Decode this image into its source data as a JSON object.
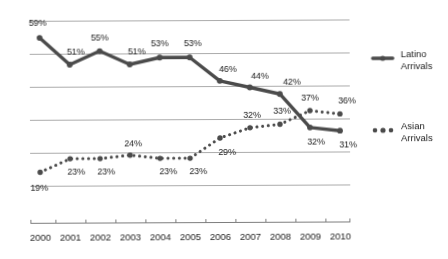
{
  "chart_data": {
    "type": "line",
    "title": "",
    "subtitle": "",
    "xlabel": "",
    "ylabel": "",
    "categories": [
      "2000",
      "2001",
      "2002",
      "2003",
      "2004",
      "2005",
      "2006",
      "2007",
      "2008",
      "2009",
      "2010"
    ],
    "ylim": [
      15,
      62
    ],
    "grid": true,
    "gridlines": 6,
    "y_tick_labels": [],
    "legend_position": "right",
    "value_suffix": "%",
    "series": [
      {
        "name": "Latino Arrivals",
        "legend_label_line1": "Latino",
        "legend_label_line2": "Arrivals",
        "style": "solid",
        "color": "#4d4d4d",
        "values": [
          59,
          51,
          55,
          51,
          53,
          53,
          46,
          44,
          42,
          32,
          31
        ],
        "labels": [
          "59%",
          "51%",
          "55%",
          "51%",
          "53%",
          "53%",
          "46%",
          "44%",
          "42%",
          "32%",
          "31%"
        ]
      },
      {
        "name": "Asian Arrivals",
        "legend_label_line1": "Asian",
        "legend_label_line2": "Arrivals",
        "style": "dotted",
        "color": "#4d4d4d",
        "values": [
          19,
          23,
          23,
          24,
          23,
          23,
          29,
          32,
          33,
          37,
          36
        ],
        "labels": [
          "19%",
          "23%",
          "23%",
          "24%",
          "23%",
          "23%",
          "29%",
          "32%",
          "33%",
          "37%",
          "36%"
        ]
      }
    ],
    "annotations": []
  },
  "legend": {
    "items": [
      {
        "label_line1": "Latino",
        "label_line2": "Arrivals",
        "marker": "solid-line-marker"
      },
      {
        "label_line1": "Asian",
        "label_line2": "Arrivals",
        "marker": "dotted-line-marker"
      }
    ]
  },
  "axis": {
    "x_tick_labels": [
      "2000",
      "2001",
      "2002",
      "2003",
      "2004",
      "2005",
      "2006",
      "2007",
      "2008",
      "2009",
      "2010"
    ]
  }
}
